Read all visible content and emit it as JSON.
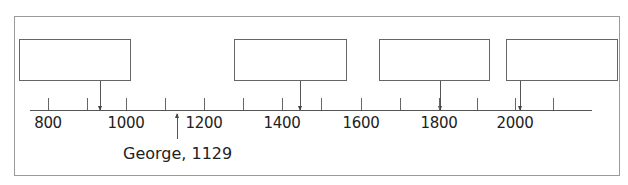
{
  "timeline": {
    "axis_labels": [
      {
        "year": "800",
        "x": 48
      },
      {
        "year": "1000",
        "x": 126
      },
      {
        "year": "1200",
        "x": 204
      },
      {
        "year": "1400",
        "x": 282
      },
      {
        "year": "1600",
        "x": 361
      },
      {
        "year": "1800",
        "x": 439
      },
      {
        "year": "2000",
        "x": 515
      }
    ],
    "ticks_x": [
      48,
      87,
      126,
      165,
      204,
      243,
      282,
      321,
      361,
      400,
      439,
      477,
      515,
      553
    ],
    "boxes": [
      {
        "left": 19,
        "width": 112,
        "text": "",
        "arrow_x": 100
      },
      {
        "left": 234,
        "width": 113,
        "text": "",
        "arrow_x": 300
      },
      {
        "left": 379,
        "width": 111,
        "text": "",
        "arrow_x": 440
      },
      {
        "left": 506,
        "width": 112,
        "text": "",
        "arrow_x": 520
      }
    ],
    "annotation": {
      "text": "George, 1129",
      "arrow_x": 177
    }
  }
}
